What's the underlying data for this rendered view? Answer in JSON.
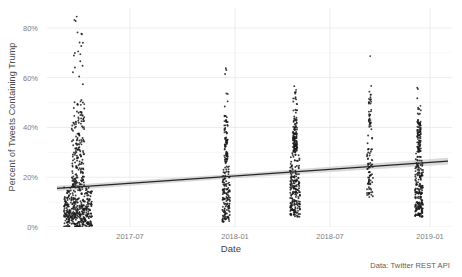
{
  "chart_data": {
    "type": "scatter",
    "title": "",
    "xlabel": "Date",
    "ylabel": "Percent of Tweets Containing Trump",
    "caption": "Data: Twitter REST API",
    "grid": true,
    "legend": false,
    "theme": "light-minimal",
    "point_color": "#1a1a1a",
    "trend_line_color": "#262626",
    "confidence_band_color": "#b9b9b9",
    "panel_background": "#ffffff",
    "grid_color": "#ebebeb",
    "xlim": [
      "2017-02",
      "2019-02"
    ],
    "ylim": [
      0,
      88
    ],
    "yticks": [
      0,
      20,
      40,
      60,
      80
    ],
    "ytick_labels": [
      "0%",
      "20%",
      "40%",
      "60%",
      "80%"
    ],
    "xticks": [
      "2017-07",
      "2018-01",
      "2018-07",
      "2019-01"
    ],
    "xtick_labels": [
      "2017-07",
      "2018-01",
      "2018-07",
      "2019-01"
    ],
    "xtick_positions_px": [
      130,
      235,
      330,
      430
    ],
    "trend_line": {
      "x_start_px": 57,
      "y_start_pct": 15.5,
      "x_end_px": 448,
      "y_end_pct": 26.5,
      "slope_pct_per_year": 5.5
    },
    "clusters": [
      {
        "name": "cluster-2017-04",
        "x_center_px": 78,
        "jitter_px": 14,
        "n_points": 600,
        "y_min_pct": 0,
        "y_max_pct": 85,
        "dense_below_pct": 16,
        "description": "Large dense cluster spanning full range, heaviest mass below 16%"
      },
      {
        "name": "cluster-2018-01",
        "x_center_px": 226,
        "jitter_px": 4,
        "n_points": 220,
        "y_min_pct": 2,
        "y_max_pct": 65,
        "dense_below_pct": 26,
        "description": "Narrow vertical cluster with outliers near 55-65%"
      },
      {
        "name": "cluster-2018-05",
        "x_center_px": 295,
        "jitter_px": 5,
        "n_points": 330,
        "y_min_pct": 4,
        "y_max_pct": 57,
        "dense_below_pct": 30,
        "description": "Dense cluster centered near 22%"
      },
      {
        "name": "cluster-2018-09",
        "x_center_px": 370,
        "jitter_px": 3,
        "n_points": 110,
        "y_min_pct": 12,
        "y_max_pct": 70,
        "dense_below_pct": 40,
        "description": "Sparse vertical strip reaching 70%"
      },
      {
        "name": "cluster-2019-01",
        "x_center_px": 419,
        "jitter_px": 4,
        "n_points": 300,
        "y_min_pct": 4,
        "y_max_pct": 56,
        "dense_below_pct": 30,
        "description": "Dense cluster near right edge"
      }
    ]
  }
}
